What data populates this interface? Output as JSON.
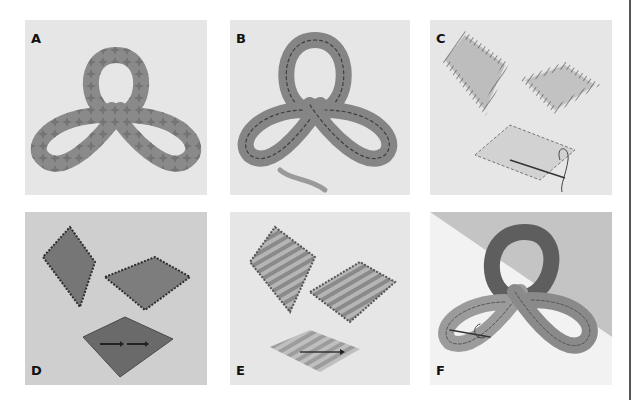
{
  "figure": {
    "panels": [
      {
        "id": "A",
        "label": "A",
        "subject": "trefoil-knot-ring-with-star-stitches"
      },
      {
        "id": "B",
        "label": "B",
        "subject": "trefoil-knot-band-with-running-stitch-and-tail"
      },
      {
        "id": "C",
        "label": "C",
        "subject": "three-diamonds-satin-stitch-with-needle"
      },
      {
        "id": "D",
        "label": "D",
        "subject": "three-dark-diamonds-pinked-edges-with-arrows"
      },
      {
        "id": "E",
        "label": "E",
        "subject": "three-striped-diamonds-zigzag-edges-with-arrow"
      },
      {
        "id": "F",
        "label": "F",
        "subject": "trefoil-knot-band-sewn-with-translucent-overlay"
      }
    ],
    "colors": {
      "page": "#ffffff",
      "panel_bg": "#e6e6e6",
      "panel_bg_dark": "#c8c8c8",
      "band": "#8f8f8f",
      "band_dark": "#5c5c5c",
      "stitch": "#444444",
      "rule": "#555555"
    }
  }
}
